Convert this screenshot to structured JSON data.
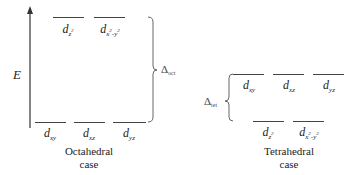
{
  "diagram": {
    "axis": {
      "label": "E",
      "direction": "up"
    },
    "octahedral": {
      "caption_line1": "Octahedral",
      "caption_line2": "case",
      "splitting_label": "Δ",
      "splitting_sub": "oct",
      "upper_levels": [
        {
          "base": "d",
          "sub": "z",
          "sup": "2"
        },
        {
          "base": "d",
          "sub": "x",
          "sup": "2",
          "sub2": "-y",
          "sup2": "2"
        }
      ],
      "lower_levels": [
        {
          "base": "d",
          "sub": "xy"
        },
        {
          "base": "d",
          "sub": "xz"
        },
        {
          "base": "d",
          "sub": "yz"
        }
      ]
    },
    "tetrahedral": {
      "caption_line1": "Tetrahedral",
      "caption_line2": "case",
      "splitting_label": "Δ",
      "splitting_sub": "tet",
      "upper_levels": [
        {
          "base": "d",
          "sub": "xy"
        },
        {
          "base": "d",
          "sub": "xz"
        },
        {
          "base": "d",
          "sub": "yz"
        }
      ],
      "lower_levels": [
        {
          "base": "d",
          "sub": "z",
          "sup": "2"
        },
        {
          "base": "d",
          "sub": "x",
          "sup": "2",
          "sub2": "-y",
          "sup2": "2"
        }
      ]
    }
  }
}
